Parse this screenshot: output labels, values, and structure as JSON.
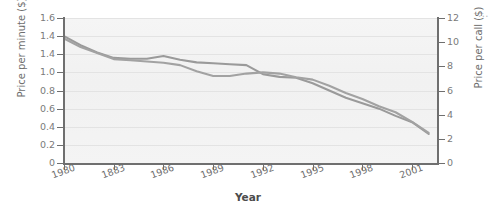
{
  "chart_data": {
    "type": "line",
    "title": "",
    "xlabel": "Year",
    "ylabel": "Price per minute ($)",
    "ylabel_right": "Price per call ($)",
    "grid": true,
    "legend_position": "none",
    "x": [
      1980,
      1981,
      1982,
      1983,
      1984,
      1985,
      1986,
      1987,
      1988,
      1989,
      1990,
      1991,
      1992,
      1993,
      1994,
      1995,
      1996,
      1997,
      1998,
      1999,
      2000,
      2001,
      2002
    ],
    "xtick_labels": [
      "1980",
      "1883",
      "1986",
      "1989",
      "1992",
      "1995",
      "1998",
      "2001"
    ],
    "xtick_values": [
      1980,
      1983,
      1986,
      1989,
      1992,
      1995,
      1998,
      2001
    ],
    "xlim": [
      1980,
      2002.5
    ],
    "ytick_labels_left": [
      "1.6",
      "1.4",
      "1.4",
      "1.0",
      "0.8",
      "0.6",
      "0.4",
      "0.2",
      "0"
    ],
    "ytick_values_left": [
      1.6,
      1.4,
      1.2,
      1.0,
      0.8,
      0.6,
      0.4,
      0.2,
      0
    ],
    "ylim_left": [
      0,
      1.6
    ],
    "ytick_labels_right": [
      "12",
      "10",
      "8",
      "6",
      "4",
      "2",
      "0"
    ],
    "ytick_values_right": [
      12,
      10,
      8,
      6,
      4,
      2,
      0
    ],
    "ylim_right": [
      0,
      12
    ],
    "series": [
      {
        "name": "Price per minute ($)",
        "axis": "left",
        "color": "#9a9a9a",
        "values": [
          1.4,
          1.3,
          1.22,
          1.16,
          1.15,
          1.15,
          1.18,
          1.14,
          1.11,
          1.1,
          1.09,
          1.08,
          0.98,
          0.95,
          0.94,
          0.88,
          0.8,
          0.72,
          0.66,
          0.6,
          0.52,
          0.45,
          0.32
        ]
      },
      {
        "name": "Price per call ($)",
        "axis": "right",
        "color": "#a2a2a2",
        "values": [
          10.3,
          9.6,
          9.1,
          8.6,
          8.5,
          8.4,
          8.3,
          8.1,
          7.6,
          7.2,
          7.2,
          7.4,
          7.5,
          7.4,
          7.1,
          6.9,
          6.4,
          5.8,
          5.3,
          4.7,
          4.2,
          3.4,
          2.5
        ]
      }
    ]
  },
  "markers": {
    "ellipsis": "..."
  }
}
